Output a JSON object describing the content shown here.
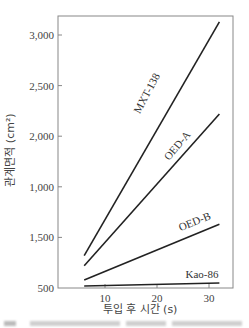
{
  "chart_data": {
    "type": "line",
    "title": "",
    "xlabel": "투입 후 시간 (s)",
    "ylabel": "관계면적 (cm²)",
    "xlim": [
      1,
      34.6
    ],
    "ylim": [
      500,
      3200
    ],
    "x_ticks": [
      10,
      20,
      30
    ],
    "x_tick_labels": [
      "10",
      "20",
      "30"
    ],
    "y_ticks": [
      500,
      1000,
      1500,
      2000,
      2500,
      3000
    ],
    "y_tick_labels": [
      "500",
      "1,500",
      "1,000",
      "2,000",
      "2,500",
      "3,000"
    ],
    "grid": false,
    "legend": "inline labels along lines",
    "series": [
      {
        "name": "MXT-138",
        "x": [
          6,
          32
        ],
        "values": [
          820,
          3130
        ],
        "label_pos": [
          150,
          95
        ],
        "label_angle": -62
      },
      {
        "name": "OED-A",
        "x": [
          6,
          32
        ],
        "values": [
          720,
          2220
        ],
        "label_pos": [
          180,
          148
        ],
        "label_angle": -50
      },
      {
        "name": "OED-B",
        "x": [
          6,
          32
        ],
        "values": [
          580,
          1130
        ],
        "label_pos": [
          196,
          225
        ],
        "label_angle": -22
      },
      {
        "name": "Kao-86",
        "x": [
          6,
          32
        ],
        "values": [
          520,
          550
        ],
        "label_pos": [
          202,
          278
        ],
        "label_angle": 0
      }
    ]
  }
}
